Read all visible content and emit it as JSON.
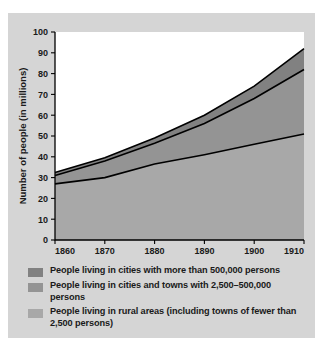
{
  "chart_data": {
    "type": "area",
    "title": "",
    "xlabel": "",
    "ylabel": "Number of people (in millions)",
    "x": [
      1860,
      1870,
      1880,
      1890,
      1900,
      1910
    ],
    "xticklabels": [
      "1860",
      "1870",
      "1880",
      "1890",
      "1900",
      "1910"
    ],
    "xlim": [
      1860,
      1910
    ],
    "ylim": [
      0,
      100
    ],
    "yticks": [
      0,
      10,
      20,
      30,
      40,
      50,
      60,
      70,
      80,
      90,
      100
    ],
    "yticklabels": [
      "0",
      "10",
      "20",
      "30",
      "40",
      "50",
      "60",
      "70",
      "80",
      "90",
      "100"
    ],
    "grid": false,
    "stacked": true,
    "legend_position": "below",
    "series": [
      {
        "name": "People living in rural areas (including towns of fewer than 2,500 persons)",
        "values": [
          27,
          30,
          36.5,
          41,
          46,
          51
        ],
        "cumulative": [
          27,
          30,
          36.5,
          41,
          46,
          51
        ],
        "color": "#a8a8a8"
      },
      {
        "name": "People living in cities and towns with 2,500–500,000 persons",
        "values": [
          4,
          8,
          10,
          15,
          22,
          31
        ],
        "cumulative": [
          31,
          38,
          46.5,
          56,
          68,
          82
        ],
        "color": "#949494"
      },
      {
        "name": "People living in cities with more than 500,000 persons",
        "values": [
          1.5,
          1.5,
          2.5,
          4,
          6,
          10
        ],
        "cumulative": [
          32.5,
          39.5,
          49,
          60,
          74,
          92
        ],
        "color": "#818181"
      }
    ]
  },
  "legend": {
    "items": [
      {
        "label": "People living in cities with more than 500,000 persons",
        "color": "#818181"
      },
      {
        "label": "People living in cities and towns with 2,500–500,000 persons",
        "color": "#949494"
      },
      {
        "label": "People living in rural areas (including towns of fewer than 2,500 persons)",
        "color": "#a8a8a8"
      }
    ]
  },
  "figure": {
    "background_color": "#d5d5d5",
    "plot_background_color": "#ffffff",
    "axis_color": "#000000"
  }
}
